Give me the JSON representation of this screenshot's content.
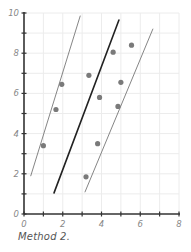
{
  "chart_data": {
    "type": "scatter",
    "title": "",
    "caption": "Method 2.",
    "xlabel": "",
    "ylabel": "",
    "xlim": [
      0,
      8
    ],
    "ylim": [
      0,
      10
    ],
    "x_ticks": [
      0,
      2,
      4,
      6,
      8
    ],
    "y_ticks": [
      0,
      2,
      4,
      6,
      8,
      10
    ],
    "x_minor_ticks": [
      1,
      3,
      5,
      7
    ],
    "y_minor_ticks": [
      1,
      3,
      5,
      7,
      9
    ],
    "grid": true,
    "legend": null,
    "points": [
      {
        "x": 1.0,
        "y": 3.4
      },
      {
        "x": 1.65,
        "y": 5.2
      },
      {
        "x": 1.95,
        "y": 6.45
      },
      {
        "x": 3.2,
        "y": 1.85
      },
      {
        "x": 3.35,
        "y": 6.9
      },
      {
        "x": 3.8,
        "y": 3.5
      },
      {
        "x": 3.9,
        "y": 5.8
      },
      {
        "x": 4.6,
        "y": 8.05
      },
      {
        "x": 4.85,
        "y": 5.35
      },
      {
        "x": 5.0,
        "y": 6.55
      },
      {
        "x": 5.55,
        "y": 8.4
      }
    ],
    "lines": [
      {
        "name": "upper-boundary",
        "x": [
          0.35,
          2.9
        ],
        "y": [
          1.9,
          9.85
        ],
        "style": "thin"
      },
      {
        "name": "fit-line",
        "x": [
          1.55,
          4.9
        ],
        "y": [
          1.05,
          9.65
        ],
        "style": "thick"
      },
      {
        "name": "lower-boundary",
        "x": [
          3.15,
          6.65
        ],
        "y": [
          1.1,
          9.2
        ],
        "style": "thin"
      }
    ],
    "colors": {
      "points": "#7a7a7a",
      "thin_line": "#777777",
      "thick_line": "#222222",
      "axis": "#333333",
      "grid": "#ececec",
      "tick_label": "#888888"
    }
  }
}
